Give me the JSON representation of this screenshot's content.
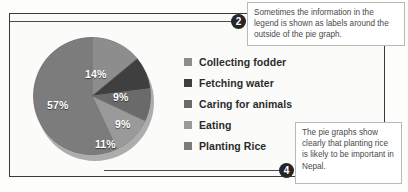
{
  "chart_data": {
    "type": "pie",
    "title": "",
    "categories": [
      "Collecting fodder",
      "Fetching water",
      "Caring for animals",
      "Eating",
      "Planting Rice"
    ],
    "values": [
      14,
      9,
      9,
      11,
      57
    ],
    "labels": [
      "14%",
      "9%",
      "9%",
      "11%",
      "57%"
    ],
    "colors": [
      "#8d8d8d",
      "#3f3f3f",
      "#6a6a6a",
      "#9a9a9a",
      "#7c7c7c"
    ],
    "legend_position": "right",
    "grid": false,
    "units": "percent"
  },
  "legend": {
    "items": [
      {
        "label": "Collecting fodder",
        "color": "#8d8d8d"
      },
      {
        "label": "Fetching water",
        "color": "#3f3f3f"
      },
      {
        "label": "Caring for animals",
        "color": "#6a6a6a"
      },
      {
        "label": "Eating",
        "color": "#9a9a9a"
      },
      {
        "label": "Planting Rice",
        "color": "#7c7c7c"
      }
    ]
  },
  "callouts": [
    {
      "number": "2",
      "text": "Sometimes the information in the legend is shown as labels around the outside of the pie graph."
    },
    {
      "number": "4",
      "text": "The pie graphs show clearly that planting rice is likely to be important in Nepal."
    }
  ]
}
